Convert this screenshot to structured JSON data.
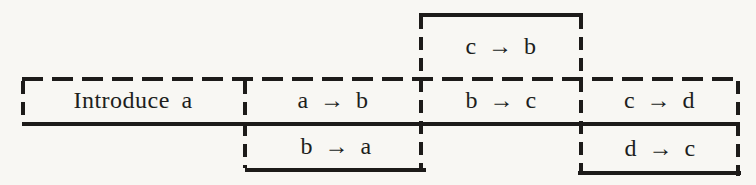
{
  "figure": {
    "background_color": "#f8f7f3",
    "line_color": "#1d1b19",
    "cells": [
      {
        "id": "introduce-a",
        "label": "Introduce a"
      },
      {
        "id": "a-to-b",
        "label": "a → b"
      },
      {
        "id": "b-to-a",
        "label": "b → a"
      },
      {
        "id": "c-to-b",
        "label": "c → b"
      },
      {
        "id": "b-to-c",
        "label": "b → c"
      },
      {
        "id": "c-to-d",
        "label": "c → d"
      },
      {
        "id": "d-to-c",
        "label": "d → c"
      }
    ]
  }
}
